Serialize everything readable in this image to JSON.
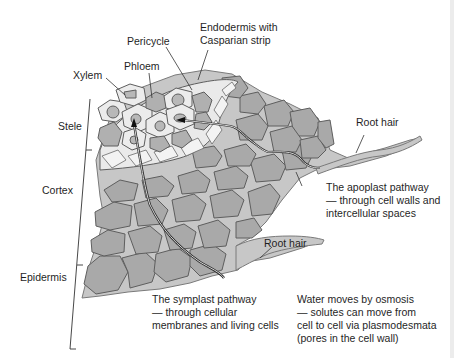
{
  "diagram": {
    "colors": {
      "background": "#ffffff",
      "cortex_cell_fill": "#a9a9a9",
      "cortex_wall": "#c4c4c4",
      "cell_outline": "#5e5e5e",
      "stele_cell_fill": "#ececec",
      "stele_inner_fill": "#b8b8b8",
      "endodermis_fill": "#e6e6e6",
      "pathway_line": "#2a2a2a",
      "label_text": "#1f1f1f"
    },
    "labels": {
      "endodermis": [
        "Endodermis with",
        "Casparian strip"
      ],
      "pericycle": "Pericycle",
      "phloem": "Phloem",
      "xylem": "Xylem",
      "stele": "Stele",
      "cortex": "Cortex",
      "epidermis": "Epidermis",
      "root_hair_upper": "Root hair",
      "root_hair_lower": "Root hair",
      "apoplast": [
        "The apoplast pathway",
        "— through cell walls and",
        "intercellular spaces"
      ],
      "symplast": [
        "The symplast pathway",
        "— through cellular",
        "membranes and living cells"
      ],
      "osmosis": [
        "Water moves by osmosis",
        "— solutes can move from",
        "cell to cell via plasmodesmata",
        "(pores in the cell wall)"
      ]
    },
    "regions": [
      "Stele",
      "Cortex",
      "Epidermis"
    ]
  }
}
